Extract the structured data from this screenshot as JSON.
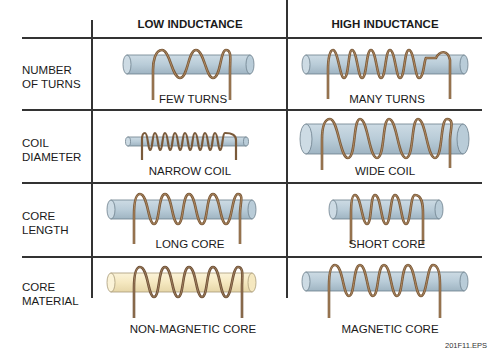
{
  "headers": {
    "low": "LOW INDUCTANCE",
    "high": "HIGH INDUCTANCE"
  },
  "rows": [
    {
      "label_line1": "NUMBER",
      "label_line2": "OF TURNS",
      "low_caption": "FEW TURNS",
      "high_caption": "MANY TURNS"
    },
    {
      "label_line1": "COIL",
      "label_line2": "DIAMETER",
      "low_caption": "NARROW COIL",
      "high_caption": "WIDE COIL"
    },
    {
      "label_line1": "CORE",
      "label_line2": "LENGTH",
      "low_caption": "LONG CORE",
      "high_caption": "SHORT CORE"
    },
    {
      "label_line1": "CORE",
      "label_line2": "MATERIAL",
      "low_caption": "NON-MAGNETIC CORE",
      "high_caption": "MAGNETIC CORE"
    }
  ],
  "footer": "201F11.EPS",
  "colors": {
    "core_magnetic": "#b9ccd8",
    "core_nonmagnetic": "#f7ecc8",
    "wire": "#8a6a4a",
    "grid": "#333333"
  }
}
